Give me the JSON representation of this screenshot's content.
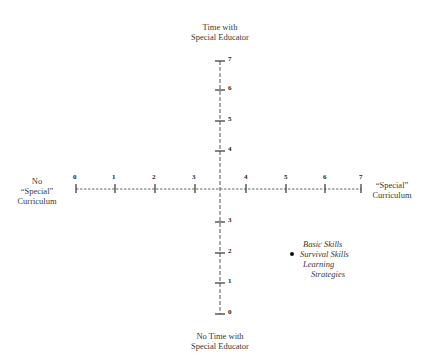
{
  "diagram": {
    "axes": {
      "top_label": [
        "Time with",
        "Special Educator"
      ],
      "bottom_label": [
        "No Time with",
        "Special Educator"
      ],
      "left_label": [
        "No",
        "“Special”",
        "Curriculum"
      ],
      "right_label": [
        "“Special”",
        "Curriculum"
      ]
    },
    "horizontal_ticks": [
      "0",
      "1",
      "2",
      "3",
      "4",
      "5",
      "6",
      "7"
    ],
    "vertical_ticks_upper": [
      "7",
      "6",
      "5",
      "4"
    ],
    "vertical_ticks_lower": [
      "3",
      "2",
      "1",
      "0"
    ],
    "legend": {
      "lines": [
        "Basic Skills",
        "Survival Skills",
        "Learning",
        "Strategies"
      ],
      "marker": "bullet"
    }
  }
}
